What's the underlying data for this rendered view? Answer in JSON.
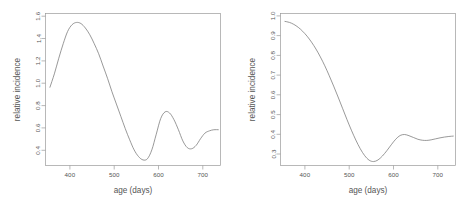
{
  "figure": {
    "background_color": "#ffffff",
    "line_color": "#777777",
    "axis_color": "#9a9a9a",
    "text_color": "#555555",
    "panel_count": 2
  },
  "chart_data": [
    {
      "type": "line",
      "panel": "left",
      "title": "",
      "xlabel": "age (days)",
      "ylabel": "relative incidence",
      "xlim": [
        345,
        740
      ],
      "ylim": [
        0.3,
        1.66
      ],
      "xticks": [
        400,
        500,
        600,
        700
      ],
      "xticklabels": [
        "400",
        "500",
        "600",
        "700"
      ],
      "yticks": [
        0.4,
        0.6,
        0.8,
        1.0,
        1.2,
        1.4,
        1.6
      ],
      "yticklabels": [
        "0.4",
        "0.6",
        "0.8",
        "1.0",
        "1.2",
        "1.4",
        "1.6"
      ],
      "grid": false,
      "legend": "none",
      "series": [
        {
          "name": "relative incidence",
          "x": [
            355,
            365,
            375,
            385,
            395,
            405,
            415,
            425,
            435,
            445,
            455,
            465,
            475,
            485,
            495,
            505,
            515,
            525,
            535,
            545,
            555,
            565,
            575,
            585,
            595,
            605,
            615,
            625,
            635,
            645,
            655,
            665,
            675,
            685,
            695,
            705,
            715,
            725,
            735
          ],
          "y": [
            1.0,
            1.12,
            1.26,
            1.39,
            1.5,
            1.56,
            1.58,
            1.57,
            1.53,
            1.47,
            1.39,
            1.3,
            1.19,
            1.08,
            0.96,
            0.85,
            0.74,
            0.63,
            0.53,
            0.44,
            0.38,
            0.35,
            0.36,
            0.44,
            0.58,
            0.72,
            0.78,
            0.77,
            0.71,
            0.62,
            0.52,
            0.46,
            0.45,
            0.48,
            0.54,
            0.59,
            0.61,
            0.62,
            0.62
          ]
        }
      ]
    },
    {
      "type": "line",
      "panel": "right",
      "title": "",
      "xlabel": "age (days)",
      "ylabel": "relative incidence",
      "xlim": [
        345,
        740
      ],
      "ylim": [
        0.27,
        1.04
      ],
      "xticks": [
        400,
        500,
        600,
        700
      ],
      "xticklabels": [
        "400",
        "500",
        "600",
        "700"
      ],
      "yticks": [
        0.3,
        0.4,
        0.5,
        0.6,
        0.7,
        0.8,
        0.9,
        1.0
      ],
      "yticklabels": [
        "0.3",
        "0.4",
        "0.5",
        "0.6",
        "0.7",
        "0.8",
        "0.9",
        "1.0"
      ],
      "grid": false,
      "legend": "none",
      "series": [
        {
          "name": "relative incidence",
          "x": [
            355,
            365,
            375,
            385,
            395,
            405,
            415,
            425,
            435,
            445,
            455,
            465,
            475,
            485,
            495,
            505,
            515,
            525,
            535,
            545,
            555,
            565,
            575,
            585,
            595,
            605,
            615,
            625,
            635,
            645,
            655,
            665,
            675,
            685,
            695,
            705,
            715,
            725,
            735
          ],
          "y": [
            1.0,
            0.995,
            0.985,
            0.97,
            0.95,
            0.925,
            0.895,
            0.86,
            0.82,
            0.775,
            0.725,
            0.672,
            0.617,
            0.56,
            0.503,
            0.449,
            0.399,
            0.355,
            0.32,
            0.297,
            0.29,
            0.298,
            0.318,
            0.345,
            0.375,
            0.403,
            0.422,
            0.427,
            0.421,
            0.412,
            0.403,
            0.398,
            0.397,
            0.4,
            0.405,
            0.41,
            0.414,
            0.417,
            0.419
          ]
        }
      ]
    }
  ]
}
